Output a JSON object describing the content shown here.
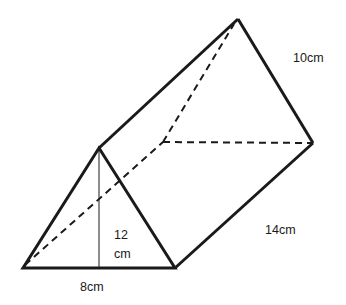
{
  "diagram": {
    "type": "triangular-prism",
    "stroke_color": "#1a1a1a",
    "background": "#ffffff",
    "vertices": {
      "front_apex": [
        99,
        148
      ],
      "front_bottom_left": [
        23,
        268
      ],
      "front_bottom_right": [
        175,
        268
      ],
      "back_apex": [
        238,
        19
      ],
      "back_bottom_left": [
        163,
        142
      ],
      "back_bottom_right": [
        313,
        143
      ]
    },
    "labels": {
      "slant_edge": "10cm",
      "length": "14cm",
      "height_top": "12",
      "height_bottom": "cm",
      "base": "8cm"
    }
  }
}
